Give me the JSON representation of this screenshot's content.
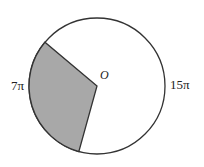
{
  "diagram": {
    "center_label": "O",
    "arc_labels": {
      "shaded_arc": "7π",
      "unshaded_arc": "15π"
    },
    "colors": {
      "sector_fill": "#a8a8a8",
      "stroke": "#333333",
      "background": "#ffffff"
    }
  }
}
